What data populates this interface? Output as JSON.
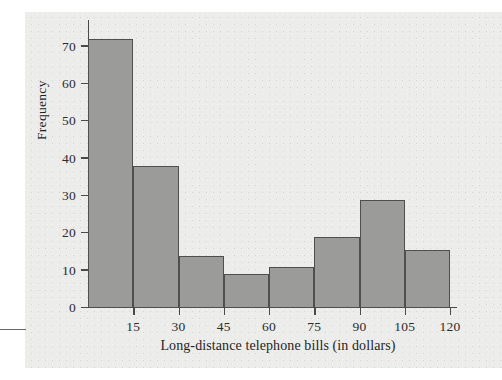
{
  "figure": {
    "background_color": "#ececeb",
    "bar_fill_color": "#9b9b9a",
    "bar_edge_color": "#4f4f4f",
    "axis_color": "#4a4a4a",
    "text_color": "#1f1f1f"
  },
  "chart_data": {
    "type": "bar",
    "title": "",
    "subtitle": "",
    "xlabel": "Long-distance telephone bills (in dollars)",
    "ylabel": "Frequency",
    "bin_width": 15,
    "bin_edges": [
      0,
      15,
      30,
      45,
      60,
      75,
      90,
      105,
      120
    ],
    "categories": [
      "0-15",
      "15-30",
      "30-45",
      "45-60",
      "60-75",
      "75-90",
      "90-105",
      "105-120"
    ],
    "values": [
      72,
      38,
      14,
      9,
      11,
      19,
      29,
      15.5
    ],
    "xlim": [
      0,
      120
    ],
    "ylim": [
      0,
      75
    ],
    "xticks": [
      15,
      30,
      45,
      60,
      75,
      90,
      105,
      120
    ],
    "xtick_labels": [
      "15",
      "30",
      "45",
      "60",
      "75",
      "90",
      "105",
      "120"
    ],
    "yticks": [
      0,
      10,
      20,
      30,
      40,
      50,
      60,
      70
    ],
    "ytick_labels": [
      "0",
      "10",
      "20",
      "30",
      "40",
      "50",
      "60",
      "70"
    ],
    "grid": false,
    "legend": null,
    "annotations": []
  }
}
